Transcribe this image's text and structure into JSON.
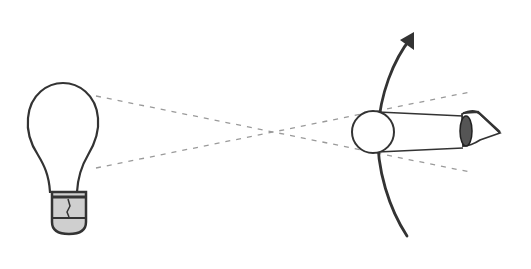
{
  "diagram": {
    "description": "Light bulb emitting rays that cross and reach an eye behind a moving ball on a curved path",
    "elements": [
      {
        "id": "light-bulb",
        "label": "light bulb"
      },
      {
        "id": "light-rays",
        "label": "dashed rays crossing"
      },
      {
        "id": "ball",
        "label": "ball"
      },
      {
        "id": "motion-arc",
        "label": "curved path with arrow"
      },
      {
        "id": "eye",
        "label": "eye"
      }
    ],
    "colors": {
      "stroke": "#333333",
      "dashed": "#9a9a9a",
      "bulb_base": "#cfcfcf",
      "iris": "#555555",
      "background": "#ffffff"
    }
  }
}
